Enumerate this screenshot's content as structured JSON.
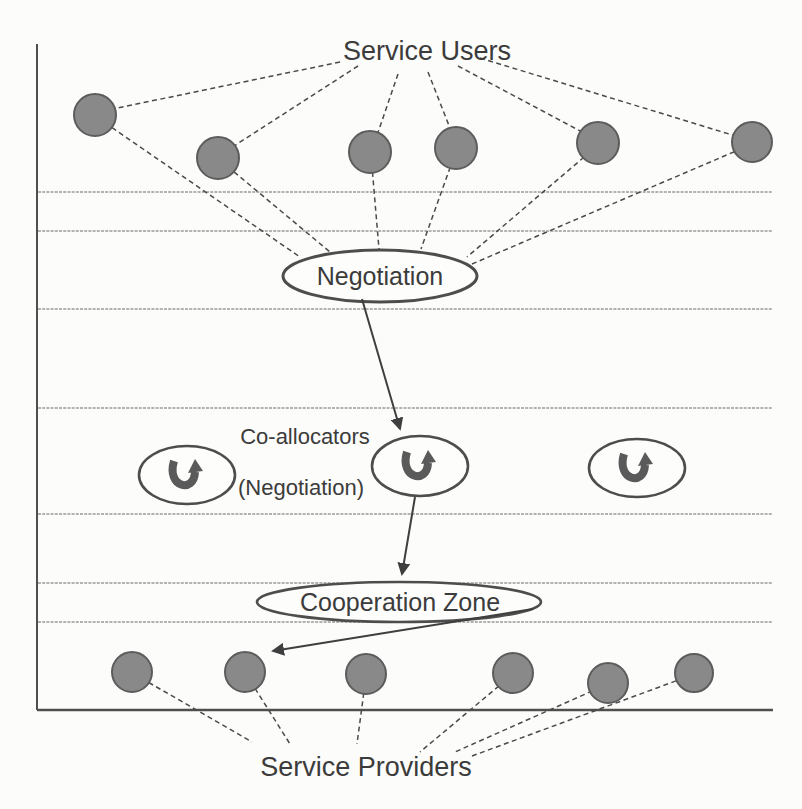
{
  "diagram": {
    "title_context": "Grid service co-allocation negotiation diagram",
    "labels": {
      "service_users": "Service Users",
      "negotiation": "Negotiation",
      "co_allocators": "Co-allocators",
      "co_allocators_sub": "(Negotiation)",
      "cooperation_zone": "Cooperation Zone",
      "service_providers": "Service Providers"
    },
    "nodes": {
      "service_user_count": 6,
      "co_allocator_count": 3,
      "service_provider_count": 6
    },
    "flow": [
      "Service Users",
      "Negotiation",
      "Co-allocators (Negotiation)",
      "Cooperation Zone",
      "Service Providers"
    ],
    "colors": {
      "background": "#fcfcfa",
      "node_fill": "#898989",
      "node_stroke": "#5c5c5c",
      "ellipse_stroke": "#4d4d4d",
      "ellipse_fill": "#fdfdfc",
      "connector": "#4a4a4a",
      "rule_line": "#9b9b9b",
      "frame": "#4f4f4f",
      "uturn_arrow": "#5a5a5a",
      "text": "#3b3b3b"
    }
  }
}
